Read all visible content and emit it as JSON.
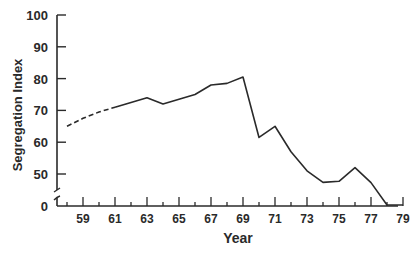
{
  "chart_data": {
    "type": "line",
    "title": "",
    "xlabel": "Year",
    "ylabel": "Segregation Index",
    "x_tick_labels": [
      "59",
      "61",
      "63",
      "65",
      "67",
      "69",
      "71",
      "73",
      "75",
      "77",
      "79"
    ],
    "y_tick_labels": [
      "0",
      "50",
      "60",
      "70",
      "80",
      "90",
      "100"
    ],
    "ylim": [
      0,
      100
    ],
    "y_axis_break": "between 0 and 50",
    "grid": false,
    "legend": null,
    "series": [
      {
        "name": "Segregation Index",
        "style_note": "dashed from 1958 to 1961, solid thereafter",
        "x": [
          58,
          59,
          60,
          61,
          62,
          63,
          64,
          65,
          66,
          67,
          68,
          69,
          70,
          71,
          72,
          73,
          74,
          75,
          76,
          77,
          78,
          79
        ],
        "values": [
          65,
          67.5,
          69.5,
          71,
          72.5,
          74,
          72,
          73.5,
          75,
          78,
          78.5,
          80.5,
          61.5,
          65,
          57,
          51,
          45.5,
          47.5,
          52,
          45,
          40,
          40
        ]
      }
    ]
  },
  "colors": {
    "line": "#2a2a2a",
    "axis": "#2a2a2a",
    "background": "#ffffff"
  }
}
